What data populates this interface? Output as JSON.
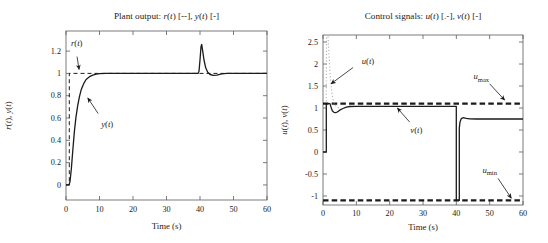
{
  "figure": {
    "background": "#ffffff",
    "line_color": "#1b1b1b",
    "dotted_color": "#b3b3b3",
    "axis_color": "#5a5a5a"
  },
  "chart_data": [
    {
      "name": "plant-output",
      "type": "line",
      "title": "Plant output: *r*(*t*) [--], *y*(*t*) [-]",
      "xlabel": "Time (s)",
      "ylabel": "*r*(*t*), *y*(*t*)",
      "xlim": [
        0,
        60
      ],
      "ylim": [
        -0.135,
        1.38
      ],
      "grid": false,
      "xticks": [
        0,
        10,
        20,
        30,
        40,
        50,
        60
      ],
      "xtick_labels": [
        "0",
        "10",
        "20",
        "30",
        "40",
        "50",
        "60"
      ],
      "yticks": [
        0,
        0.2,
        0.4,
        0.6,
        0.8,
        1,
        1.2
      ],
      "ytick_labels": [
        "0",
        "0.2",
        "0.4",
        "0.6",
        "0.8",
        "1",
        "1.2"
      ],
      "series": [
        {
          "name": "r(t)",
          "style": "dashed",
          "color": "#1b1b1b",
          "width": 1.0,
          "points": [
            [
              0,
              0
            ],
            [
              1,
              0
            ],
            [
              1,
              1
            ],
            [
              60,
              1
            ]
          ]
        },
        {
          "name": "y(t)",
          "style": "solid",
          "color": "#1b1b1b",
          "width": 1.3,
          "points": [
            [
              0,
              0
            ],
            [
              0.9,
              0
            ],
            [
              1.2,
              0.03
            ],
            [
              1.6,
              0.15
            ],
            [
              2,
              0.3
            ],
            [
              2.5,
              0.48
            ],
            [
              3,
              0.61
            ],
            [
              3.5,
              0.71
            ],
            [
              4,
              0.79
            ],
            [
              4.5,
              0.85
            ],
            [
              5,
              0.89
            ],
            [
              5.5,
              0.92
            ],
            [
              6,
              0.945
            ],
            [
              7,
              0.97
            ],
            [
              8,
              0.985
            ],
            [
              9,
              0.993
            ],
            [
              10,
              0.997
            ],
            [
              12,
              1.0
            ],
            [
              39.4,
              1.0
            ],
            [
              39.7,
              1.02
            ],
            [
              40,
              1.12
            ],
            [
              40.3,
              1.24
            ],
            [
              40.5,
              1.26
            ],
            [
              40.8,
              1.2
            ],
            [
              41.2,
              1.12
            ],
            [
              41.7,
              1.05
            ],
            [
              42.3,
              1.01
            ],
            [
              43,
              0.99
            ],
            [
              44,
              0.982
            ],
            [
              45,
              0.985
            ],
            [
              46.5,
              0.995
            ],
            [
              48,
              1.0
            ],
            [
              60,
              1.0
            ]
          ]
        }
      ],
      "annotations": [
        {
          "text": "*r*(*t*)",
          "tx": 3.2,
          "ty": 1.27,
          "x1": 3.3,
          "y1": 1.15,
          "x2": 3.9,
          "y2": 1.035
        },
        {
          "text": "*y*(*t*)",
          "tx": 12.3,
          "ty": 0.55,
          "x1": 9.6,
          "y1": 0.64,
          "x2": 6.5,
          "y2": 0.78
        }
      ]
    },
    {
      "name": "control-signals",
      "type": "line",
      "title": "Control signals: *u*(*t*) [.-], *v*(*t*) [-]",
      "xlabel": "Time (s)",
      "ylabel": "*u*(*t*), *v*(*t*)",
      "xlim": [
        0,
        60
      ],
      "ylim": [
        -1.205,
        2.66
      ],
      "grid": false,
      "xticks": [
        0,
        10,
        20,
        30,
        40,
        50,
        60
      ],
      "xtick_labels": [
        "0",
        "10",
        "20",
        "30",
        "40",
        "50",
        "60"
      ],
      "yticks": [
        -1,
        -0.5,
        0,
        0.5,
        1,
        1.5,
        2,
        2.5
      ],
      "ytick_labels": [
        "-1",
        "-0.5",
        "0",
        "0.5",
        "1",
        "1.5",
        "2",
        "2.5"
      ],
      "series": [
        {
          "name": "u-max-limit",
          "style": "bold-dashed",
          "color": "#1b1b1b",
          "width": 2.2,
          "points": [
            [
              0,
              1.1
            ],
            [
              60,
              1.1
            ]
          ]
        },
        {
          "name": "u-min-limit",
          "style": "bold-dashed",
          "color": "#1b1b1b",
          "width": 2.2,
          "points": [
            [
              0,
              -1.1
            ],
            [
              60,
              -1.1
            ]
          ]
        },
        {
          "name": "u(t)",
          "style": "dotted",
          "color": "#b3b3b3",
          "width": 1.1,
          "points": [
            [
              1,
              1.15
            ],
            [
              1.04,
              2.62
            ],
            [
              1.5,
              2.62
            ],
            [
              1.75,
              2.3
            ],
            [
              2.0,
              1.9
            ],
            [
              2.3,
              1.6
            ],
            [
              2.6,
              1.38
            ],
            [
              3.0,
              1.2
            ],
            [
              3.5,
              1.08
            ],
            [
              4.2,
              1.02
            ],
            [
              5,
              0.99
            ]
          ]
        },
        {
          "name": "v(t)",
          "style": "solid",
          "color": "#1b1b1b",
          "width": 1.3,
          "points": [
            [
              0,
              0
            ],
            [
              1,
              0
            ],
            [
              1,
              1.1
            ],
            [
              2.1,
              1.1
            ],
            [
              2.4,
              1.02
            ],
            [
              2.8,
              0.94
            ],
            [
              3.3,
              0.9
            ],
            [
              3.8,
              0.895
            ],
            [
              4.3,
              0.91
            ],
            [
              5,
              0.95
            ],
            [
              6,
              0.99
            ],
            [
              7,
              1.02
            ],
            [
              8,
              1.035
            ],
            [
              10,
              1.04
            ],
            [
              40,
              1.04
            ],
            [
              40,
              -1.1
            ],
            [
              40.9,
              -1.1
            ],
            [
              40.9,
              0.55
            ],
            [
              41.1,
              0.68
            ],
            [
              41.5,
              0.76
            ],
            [
              42,
              0.78
            ],
            [
              43,
              0.765
            ],
            [
              44,
              0.755
            ],
            [
              46,
              0.75
            ],
            [
              60,
              0.75
            ]
          ]
        }
      ],
      "annotations": [
        {
          "text": "*u*(*t*)",
          "tx": 13.5,
          "ty": 2.06,
          "x1": 9.0,
          "y1": 1.92,
          "x2": 2.4,
          "y2": 1.55
        },
        {
          "text": "*u*_max",
          "tx": 47.5,
          "ty": 1.72,
          "x1": 50.0,
          "y1": 1.55,
          "x2": 54.5,
          "y2": 1.18
        },
        {
          "text": "*v*(*t*)",
          "tx": 28.0,
          "ty": 0.5,
          "x1": 26.0,
          "y1": 0.68,
          "x2": 22.3,
          "y2": 1.0
        },
        {
          "text": "*u*_min",
          "tx": 50.0,
          "ty": -0.4,
          "x1": 52.5,
          "y1": -0.6,
          "x2": 56.5,
          "y2": -1.05
        }
      ]
    }
  ]
}
